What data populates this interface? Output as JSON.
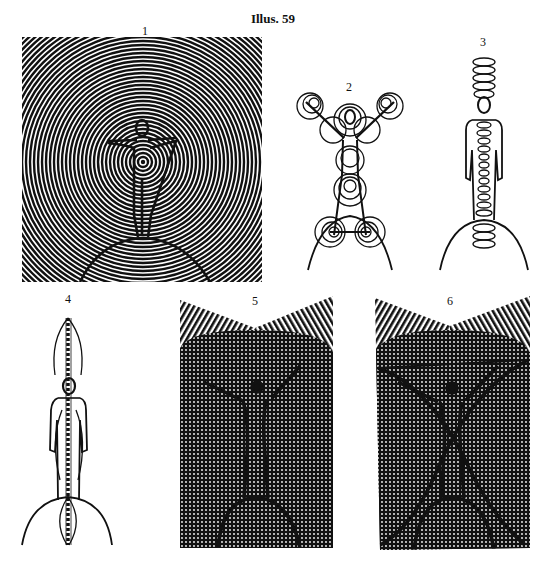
{
  "page": {
    "title": "Illus. 59"
  },
  "panels": [
    {
      "label": "1",
      "description": "Standing figure with arms outstretched on a globe, surrounded by a large square spiral field"
    },
    {
      "label": "2",
      "description": "Figure with arms raised in an X pose, concentric circular vortices at hands, chest, hips, knees and feet, standing on a globe"
    },
    {
      "label": "3",
      "description": "Standing figure with a coiled helix running vertically through the body and above the head, on a globe"
    },
    {
      "label": "4",
      "description": "Standing figure with a twisted braided column through the body inside a vertical lens-shaped aura, on a globe"
    },
    {
      "label": "5",
      "description": "Figure with arms raised in a dotted screen field with hatched V-shaped top, on a globe"
    },
    {
      "label": "6",
      "description": "Figure with arms raised in a dotted screen field with hatched V-shaped top, crossed by two intersecting arcs, on a globe"
    }
  ],
  "colors": {
    "ink": "#111111",
    "paper": "#ffffff"
  }
}
